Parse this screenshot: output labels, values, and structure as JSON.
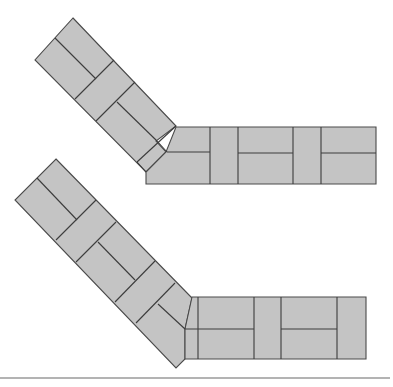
{
  "diagram": {
    "title": "",
    "colors": {
      "brick_fill": "#c4c4c4",
      "joint_stroke": "#4a4a4a",
      "rule_line": "#9a9a9a",
      "background": "#ffffff"
    },
    "figures": [
      {
        "id": "top-layout",
        "diagonal_arm": {
          "apex": [
            73,
            18
          ],
          "left_corner": [
            35,
            60
          ],
          "bricks": 6
        },
        "elbow": {
          "outer_corner": [
            176,
            126
          ],
          "inner_tip": [
            146,
            172
          ]
        },
        "horizontal_arm": {
          "x_range": [
            146,
            376
          ],
          "y_range": [
            127,
            184
          ],
          "vertical_joints_x": [
            210,
            238,
            293,
            321
          ],
          "mid_joint_y": 152
        }
      },
      {
        "id": "bottom-layout",
        "diagonal_arm": {
          "apex": [
            56,
            159
          ],
          "left_corner": [
            15,
            200
          ],
          "bricks": 7
        },
        "elbow": {
          "outer_corner": [
            192,
            298
          ],
          "inner_tip": [
            176,
            368
          ]
        },
        "horizontal_arm": {
          "x_range": [
            185,
            366
          ],
          "y_range": [
            297,
            359
          ],
          "vertical_joints_x": [
            198,
            254,
            281,
            337
          ],
          "mid_joint_y": 329
        }
      }
    ],
    "separator": {
      "y": 378,
      "x_range": [
        0,
        390
      ]
    }
  }
}
